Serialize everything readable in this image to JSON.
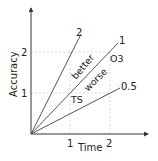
{
  "diagram": {
    "x_axis": {
      "label": "Time",
      "ticks": [
        "1",
        "2"
      ]
    },
    "y_axis": {
      "label": "Accuracy",
      "ticks": [
        "1",
        "2"
      ]
    },
    "lines": [
      {
        "slope_label": "2"
      },
      {
        "slope_label": "1"
      },
      {
        "slope_label": "0.5"
      }
    ],
    "annotations": {
      "better": "better",
      "worse": "worse",
      "ts": "TS",
      "o3": "O3"
    },
    "colors": {
      "axis": "#333333",
      "line": "#555555",
      "grid": "#cccccc",
      "text": "#222222"
    }
  }
}
